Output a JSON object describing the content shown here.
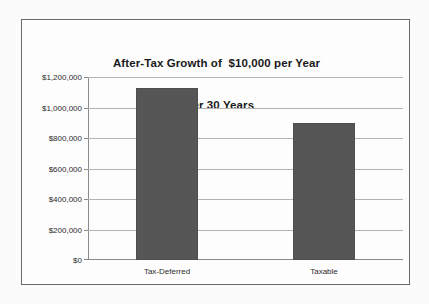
{
  "chart_data": {
    "type": "bar",
    "title": "After-Tax Growth of  $10,000 per Year\nover 30 Years",
    "title_lines": [
      "After-Tax Growth of  $10,000 per Year",
      "over 30 Years"
    ],
    "categories": [
      "Tax-Deferred",
      "Taxable"
    ],
    "values": [
      1130000,
      900000
    ],
    "xlabel": "",
    "ylabel": "",
    "ylim": [
      0,
      1200000
    ],
    "ytick_values": [
      0,
      200000,
      400000,
      600000,
      800000,
      1000000,
      1200000
    ],
    "ytick_labels": [
      "$0",
      "$200,000",
      "$400,000",
      "$600,000",
      "$800,000",
      "$1,000,000",
      "$1,200,000"
    ],
    "grid": true,
    "legend": false,
    "legend_position": "none",
    "series": [
      {
        "name": "After-Tax Growth",
        "values": [
          1130000,
          900000
        ]
      }
    ],
    "colors": {
      "bar_fill": "#565656",
      "bar_border": "#4e4e4e",
      "gridline": "#b4b4b4",
      "axis": "#8a8a8a",
      "frame_border": "#6a6a6a",
      "plot_background": "#fdfdfd",
      "canvas_background": "#fbfbfb",
      "text": "#2b2b2b",
      "title_text": "#1a1a1a"
    }
  }
}
